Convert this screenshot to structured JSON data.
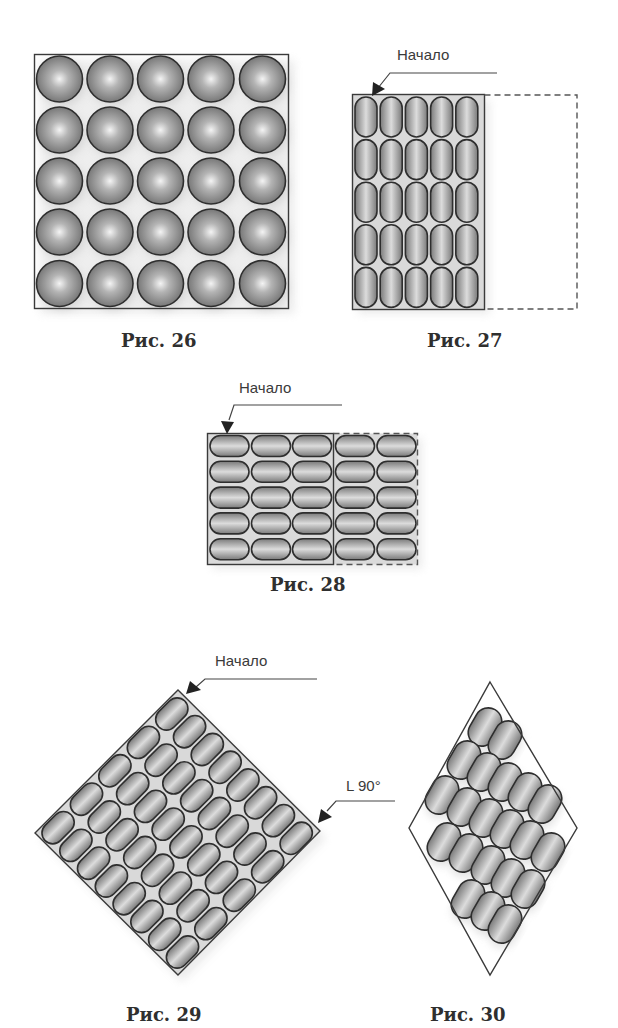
{
  "figures": {
    "fig26": {
      "caption": "Рис. 26",
      "description": "5x5 grid of spheres in a square box",
      "rows": 5,
      "cols": 5
    },
    "fig27": {
      "caption": "Рис. 27",
      "start_label": "Начало",
      "description": "5x5 upright capsules in a solid rectangle with dashed extension",
      "rows": 5,
      "cols": 5
    },
    "fig28": {
      "caption": "Рис. 28",
      "start_label": "Начало",
      "description": "5 rows of horizontal capsules: 3 columns in solid area, 2 columns in dashed area",
      "rows": 5,
      "cols_solid": 3,
      "cols_dashed": 2
    },
    "fig29": {
      "caption": "Рис. 29",
      "start_label": "Начало",
      "angle_label": "L 90°",
      "description": "square rotated 45° filled with 5x8 capsules",
      "rows": 8,
      "cols": 5
    },
    "fig30": {
      "caption": "Рис. 30",
      "description": "rhombus with 21 tilted capsules",
      "count": 21
    }
  },
  "colors": {
    "outline": "#2e2e2e",
    "fill_light": "#eeeeee",
    "fill_dark": "#7a7a7a",
    "text": "#3a3a3a"
  }
}
